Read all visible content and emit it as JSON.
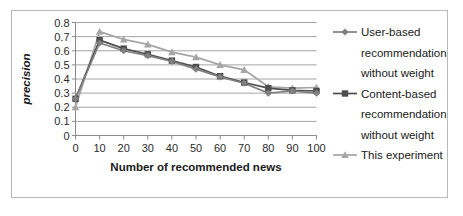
{
  "chart_data": {
    "type": "line",
    "title": "",
    "xlabel": "Number of recommended news",
    "ylabel": "precision",
    "x": [
      0,
      10,
      20,
      30,
      40,
      50,
      60,
      70,
      80,
      90,
      100
    ],
    "categories": [
      "0",
      "10",
      "20",
      "30",
      "40",
      "50",
      "60",
      "70",
      "80",
      "90",
      "100"
    ],
    "xlim": [
      0,
      100
    ],
    "ylim": [
      0,
      0.8
    ],
    "y_ticks": [
      "0",
      "0.1",
      "0.2",
      "0.3",
      "0.4",
      "0.5",
      "0.6",
      "0.7",
      "0.8"
    ],
    "y_tick_values": [
      0,
      0.1,
      0.2,
      0.3,
      0.4,
      0.5,
      0.6,
      0.7,
      0.8
    ],
    "grid": "horizontal",
    "legend_position": "right",
    "series": [
      {
        "name": "User-based recommendation without weight",
        "marker": "diamond",
        "color": "#808080",
        "values": [
          0.26,
          0.655,
          0.6,
          0.565,
          0.525,
          0.47,
          0.415,
          0.37,
          0.3,
          0.315,
          0.3
        ]
      },
      {
        "name": "Content-based recommendation without weight",
        "marker": "square",
        "color": "#4d4d4d",
        "values": [
          0.26,
          0.675,
          0.615,
          0.575,
          0.53,
          0.485,
          0.42,
          0.375,
          0.335,
          0.32,
          0.315
        ]
      },
      {
        "name": "This experiment",
        "marker": "triangle",
        "color": "#a6a6a6",
        "values": [
          0.2,
          0.735,
          0.68,
          0.645,
          0.59,
          0.555,
          0.5,
          0.465,
          0.345,
          0.335,
          0.34
        ]
      }
    ]
  },
  "legend": {
    "entries": [
      {
        "label_line1": "User-based",
        "label_line2": "recommendation",
        "label_line3": "without weight"
      },
      {
        "label_line1": "Content-based",
        "label_line2": "recommendation",
        "label_line3": "without weight"
      },
      {
        "label_line1": "This experiment",
        "label_line2": "",
        "label_line3": ""
      }
    ]
  }
}
